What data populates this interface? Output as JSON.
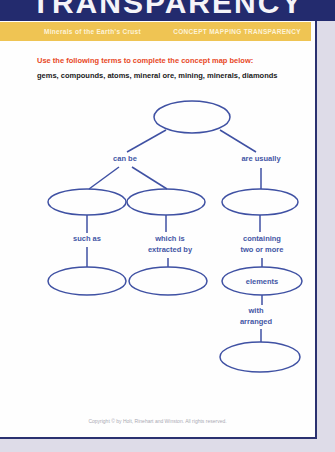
{
  "header": {
    "title": "TRANSPARENCY"
  },
  "banner": {
    "left": "Minerals of the Earth's Crust",
    "right": "CONCEPT MAPPING TRANSPARENCY"
  },
  "instructions": {
    "heading": "Use the following terms to complete the concept map below:",
    "terms": "gems, compounds, atoms, mineral ore, mining, minerals, diamonds"
  },
  "map": {
    "labels": {
      "can_be": "can be",
      "are_usually": "are usually",
      "such_as": "such as",
      "which_is_extracted_by": "which is\nextracted by",
      "containing_two_or_more": "containing\ntwo or more",
      "elements": "elements",
      "with_arranged": "with\narranged"
    },
    "empty_ovals_count": 6
  },
  "footer": {
    "copyright": "Copyright © by Holt, Rinehart and Winston. All rights reserved."
  },
  "colors": {
    "header_navy": "#232b6e",
    "banner_gold": "#efc453",
    "instruction_red": "#e8481f",
    "map_ink_blue": "#4356a5",
    "page_background": "#fefefe",
    "outer_background": "#dedce8"
  }
}
